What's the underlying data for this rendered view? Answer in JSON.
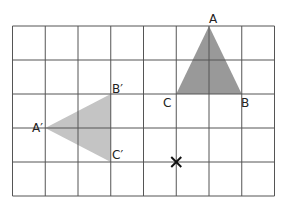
{
  "diagram": {
    "type": "grid-rotation",
    "grid": {
      "cols": 8,
      "rows": 5,
      "left": 12.5,
      "top": 26,
      "cell_w": 32.75,
      "cell_h": 34,
      "line_color": "#555555"
    },
    "triangles": [
      {
        "name": "ABC",
        "fill": "#999999",
        "vertices": {
          "A": [
            6,
            0
          ],
          "B": [
            7,
            2
          ],
          "C": [
            5,
            2
          ]
        },
        "labels": [
          {
            "text": "A",
            "x": 209,
            "y": 23
          },
          {
            "text": "B",
            "x": 241,
            "y": 107
          },
          {
            "text": "C",
            "x": 163,
            "y": 107
          }
        ]
      },
      {
        "name": "A'B'C'",
        "fill": "#c4c4c4",
        "vertices": {
          "A'": [
            1,
            3
          ],
          "B'": [
            3,
            2
          ],
          "C'": [
            3,
            4
          ]
        },
        "labels": [
          {
            "text": "A′",
            "x": 32,
            "y": 132
          },
          {
            "text": "B′",
            "x": 112,
            "y": 93
          },
          {
            "text": "C′",
            "x": 112,
            "y": 159
          }
        ]
      }
    ],
    "centre_marker": {
      "symbol": "×",
      "grid": [
        5,
        4
      ]
    }
  }
}
